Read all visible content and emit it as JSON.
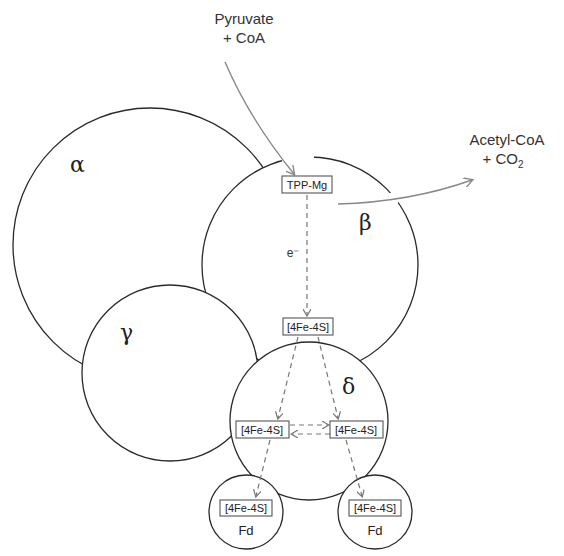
{
  "diagram": {
    "type": "enzyme-subunit-electron-transfer",
    "substrate": {
      "line1": "Pyruvate",
      "line2": "+ CoA"
    },
    "product": {
      "line1": "Acetyl-CoA",
      "line2_prefix": "+ CO",
      "line2_subscript": "2"
    },
    "subunits": [
      {
        "id": "alpha",
        "label": "α"
      },
      {
        "id": "beta",
        "label": "β"
      },
      {
        "id": "gamma",
        "label": "γ"
      },
      {
        "id": "delta",
        "label": "δ"
      }
    ],
    "cofactors": {
      "tpp": "TPP-Mg",
      "beta_cluster": "[4Fe-4S]",
      "delta_cluster_left": "[4Fe-4S]",
      "delta_cluster_right": "[4Fe-4S]",
      "fd_cluster_left": "[4Fe-4S]",
      "fd_cluster_right": "[4Fe-4S]"
    },
    "electron_label": "e⁻",
    "ferredoxins": [
      {
        "id": "fd-left",
        "label": "Fd"
      },
      {
        "id": "fd-right",
        "label": "Fd"
      }
    ],
    "colors": {
      "outline": "#2a2a2a",
      "arrow": "#888888",
      "dashed": "#777777"
    }
  }
}
